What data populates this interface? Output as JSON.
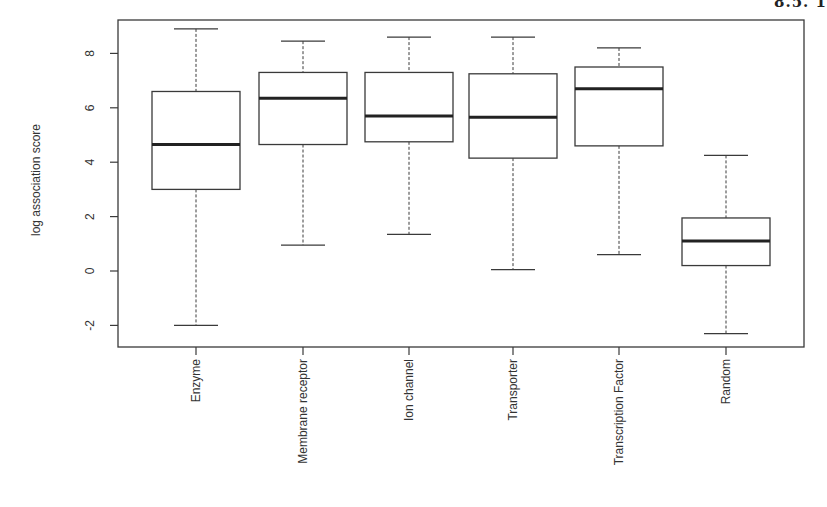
{
  "page_fragment": "8.5. 1",
  "chart_data": {
    "type": "boxplot",
    "title": "",
    "xlabel": "",
    "ylabel": "log association score",
    "ylim": [
      -2.8,
      9.1
    ],
    "yticks": [
      -2,
      0,
      2,
      4,
      6,
      8
    ],
    "ytick_labels": [
      "-2",
      "0",
      "2",
      "4",
      "6",
      "8"
    ],
    "grid": false,
    "legend": null,
    "categories": [
      "Enzyme",
      "Membrane receptor",
      "Ion channel",
      "Transporter",
      "Transcription Factor",
      "Random"
    ],
    "boxes": [
      {
        "name": "Enzyme",
        "whisker_low": -2.0,
        "q1": 3.0,
        "median": 4.65,
        "q3": 6.6,
        "whisker_high": 8.9
      },
      {
        "name": "Membrane receptor",
        "whisker_low": 0.95,
        "q1": 4.65,
        "median": 6.35,
        "q3": 7.3,
        "whisker_high": 8.45
      },
      {
        "name": "Ion channel",
        "whisker_low": 1.35,
        "q1": 4.75,
        "median": 5.7,
        "q3": 7.3,
        "whisker_high": 8.6
      },
      {
        "name": "Transporter",
        "whisker_low": 0.05,
        "q1": 4.15,
        "median": 5.65,
        "q3": 7.25,
        "whisker_high": 8.6
      },
      {
        "name": "Transcription Factor",
        "whisker_low": 0.6,
        "q1": 4.6,
        "median": 6.7,
        "q3": 7.5,
        "whisker_high": 8.2
      },
      {
        "name": "Random",
        "whisker_low": -2.3,
        "q1": 0.2,
        "median": 1.1,
        "q3": 1.95,
        "whisker_high": 4.25
      }
    ]
  }
}
